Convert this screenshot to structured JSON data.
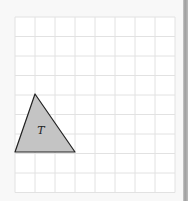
{
  "diagram": {
    "grid": {
      "x0": 15,
      "y0": 17,
      "cols": 8,
      "rows": 9,
      "cell_w": 20,
      "cell_h": 19.5,
      "line_color": "#e2e2e2",
      "background": "#ffffff"
    },
    "shape": {
      "label": "T",
      "type": "triangle",
      "fill": "#c4c4c4",
      "stroke": "#222222",
      "vertices_px": [
        [
          35,
          94
        ],
        [
          15,
          152
        ],
        [
          75,
          152
        ]
      ],
      "vertices_grid": [
        [
          1,
          4
        ],
        [
          0,
          7
        ],
        [
          3,
          7
        ]
      ]
    }
  }
}
